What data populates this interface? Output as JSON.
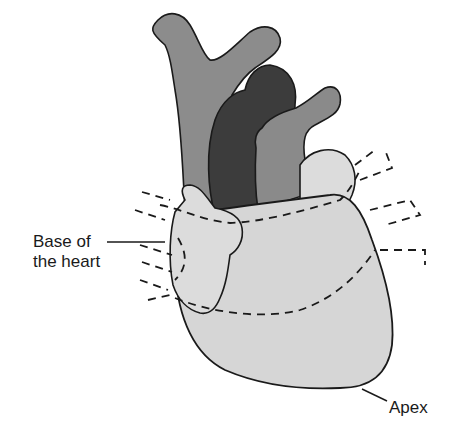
{
  "figure": {
    "type": "anatomical-diagram",
    "labels": {
      "base_line1": "Base of",
      "base_line2": "the heart",
      "apex": "Apex"
    },
    "colors": {
      "background": "#ffffff",
      "ventricle_fill": "#d6d6d6",
      "atrium_fill": "#dcdcdc",
      "vena_cava_fill": "#8c8c8c",
      "aorta_fill": "#3c3c3c",
      "pulmonary_trunk_fill": "#8a8a8a",
      "outline": "#1a1a1a"
    }
  }
}
